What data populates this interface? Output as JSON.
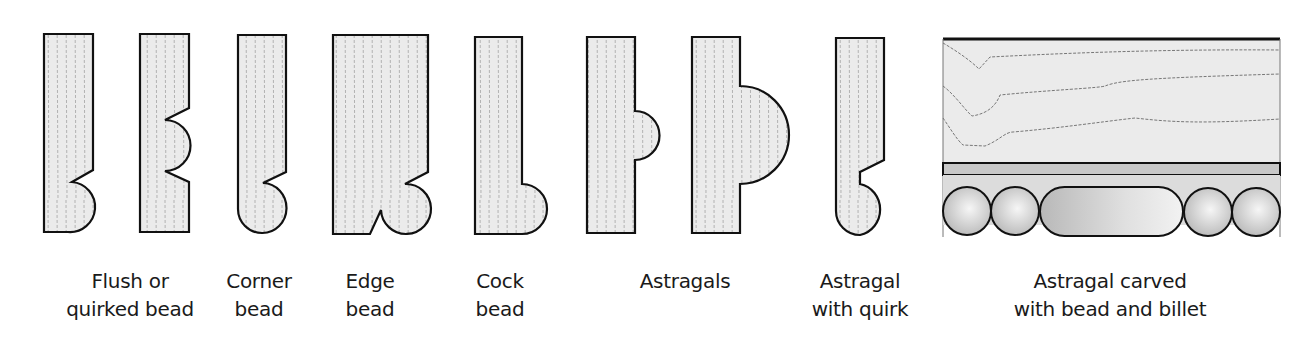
{
  "figure": {
    "type": "moulding-profiles",
    "colors": {
      "wood_fill": "#ebebeb",
      "outline": "#111111",
      "grain": "#777777",
      "band_fill": "#c8c8c8",
      "ball_light": "#f4f4f4",
      "ball_dark": "#bdbdbd"
    }
  },
  "labels": [
    {
      "id": "flush-or-quirked-bead",
      "text": "Flush or\nquirked bead"
    },
    {
      "id": "corner-bead",
      "text": "Corner\nbead"
    },
    {
      "id": "edge-bead",
      "text": "Edge\nbead"
    },
    {
      "id": "cock-bead",
      "text": "Cock\nbead"
    },
    {
      "id": "astragals",
      "text": "Astragals"
    },
    {
      "id": "astragal-with-quirk",
      "text": "Astragal\nwith quirk"
    },
    {
      "id": "astragal-carved",
      "text": "Astragal carved\nwith bead and billet"
    }
  ]
}
